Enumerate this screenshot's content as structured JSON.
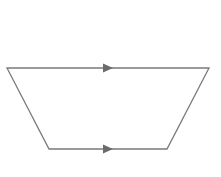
{
  "diagram": {
    "type": "trapezoid",
    "stroke_color": "#7a7a7a",
    "arrow_color": "#6b6b6b",
    "background": "#ffffff",
    "vertices": {
      "top_left": [
        7,
        68
      ],
      "top_right": [
        209,
        68
      ],
      "bottom_right": [
        167,
        149
      ],
      "bottom_left": [
        49,
        149
      ]
    },
    "parallel_markers": [
      {
        "side": "top",
        "direction": "right",
        "x": 108,
        "y": 68
      },
      {
        "side": "bottom",
        "direction": "right",
        "x": 108,
        "y": 149
      }
    ],
    "labels": []
  }
}
